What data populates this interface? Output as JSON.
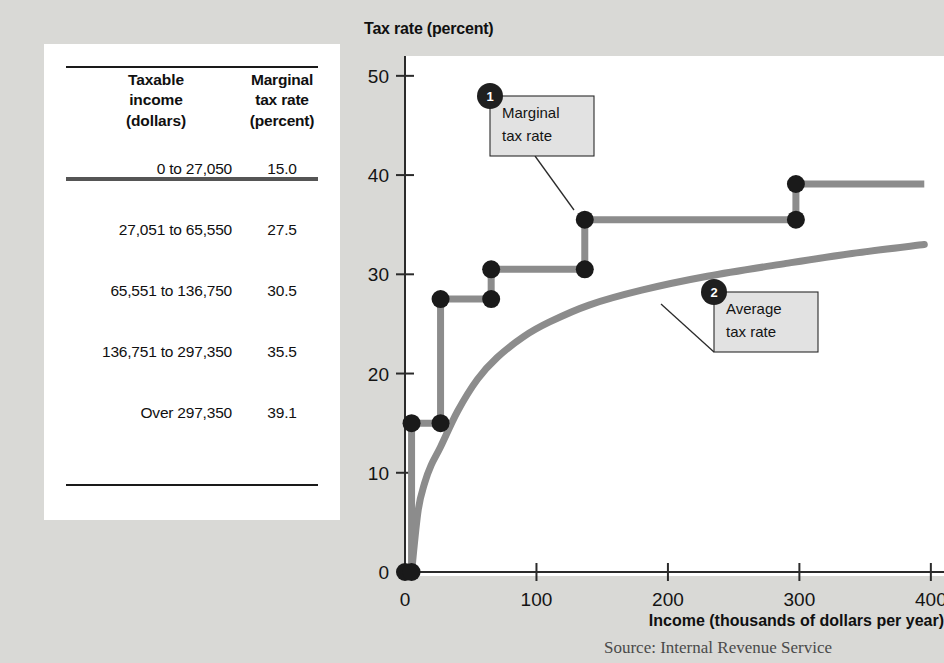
{
  "table": {
    "headers": {
      "income": [
        "Taxable",
        "income",
        "(dollars)"
      ],
      "rate": [
        "Marginal",
        "tax rate",
        "(percent)"
      ]
    },
    "rows": [
      {
        "income": "0 to 27,050",
        "rate": "15.0"
      },
      {
        "income": "27,051 to 65,550",
        "rate": "27.5"
      },
      {
        "income": "65,551 to 136,750",
        "rate": "30.5"
      },
      {
        "income": "136,751 to 297,350",
        "rate": "35.5"
      },
      {
        "income": "Over 297,350",
        "rate": "39.1"
      }
    ]
  },
  "source_note": "Source: Internal Revenue Service",
  "callouts": [
    {
      "number": "1",
      "line1": "Marginal",
      "line2": "tax rate"
    },
    {
      "number": "2",
      "line1": "Average",
      "line2": "tax rate"
    }
  ],
  "colors": {
    "page_background": "#d9d9d6",
    "plot_background": "#ffffff",
    "series_line": "#8c8c8c",
    "marker": "#1a1a1a",
    "axis": "#2b2b2b",
    "callout_fill": "#e2e2e2"
  },
  "chart_data": {
    "type": "line",
    "title": "Tax rate (percent)",
    "xlabel": "Income (thousands of dollars per year)",
    "ylabel": "Tax rate (percent)",
    "xlim": [
      0,
      410
    ],
    "ylim": [
      0,
      52
    ],
    "xticks": [
      0,
      100,
      200,
      300,
      400
    ],
    "yticks": [
      0,
      10,
      20,
      30,
      40,
      50
    ],
    "grid": false,
    "legend": "annotated-callouts",
    "series": [
      {
        "name": "Marginal tax rate",
        "style": "step",
        "brackets": [
          {
            "income_from": 0,
            "income_to": 27.05,
            "rate": 15.0
          },
          {
            "income_from": 27.051,
            "income_to": 65.55,
            "rate": 27.5
          },
          {
            "income_from": 65.551,
            "income_to": 136.75,
            "rate": 30.5
          },
          {
            "income_from": 136.751,
            "income_to": 297.35,
            "rate": 35.5
          },
          {
            "income_from": 297.35,
            "income_to": 400,
            "rate": 39.1
          }
        ],
        "markers": [
          {
            "x": 0,
            "y": 0
          },
          {
            "x": 5,
            "y": 0
          },
          {
            "x": 5,
            "y": 15.0
          },
          {
            "x": 27.05,
            "y": 15.0
          },
          {
            "x": 27.05,
            "y": 27.5
          },
          {
            "x": 65.55,
            "y": 27.5
          },
          {
            "x": 65.55,
            "y": 30.5
          },
          {
            "x": 136.75,
            "y": 30.5
          },
          {
            "x": 136.75,
            "y": 35.5
          },
          {
            "x": 297.35,
            "y": 35.5
          },
          {
            "x": 297.35,
            "y": 39.1
          }
        ]
      },
      {
        "name": "Average tax rate",
        "style": "curve",
        "points": [
          {
            "x": 5,
            "y": 0
          },
          {
            "x": 10,
            "y": 6.2
          },
          {
            "x": 15,
            "y": 9.0
          },
          {
            "x": 20,
            "y": 10.8
          },
          {
            "x": 27,
            "y": 12.6
          },
          {
            "x": 40,
            "y": 16.2
          },
          {
            "x": 55,
            "y": 19.4
          },
          {
            "x": 70,
            "y": 21.6
          },
          {
            "x": 90,
            "y": 23.7
          },
          {
            "x": 110,
            "y": 25.2
          },
          {
            "x": 140,
            "y": 26.9
          },
          {
            "x": 180,
            "y": 28.4
          },
          {
            "x": 230,
            "y": 29.8
          },
          {
            "x": 290,
            "y": 31.1
          },
          {
            "x": 340,
            "y": 32.1
          },
          {
            "x": 395,
            "y": 33.0
          }
        ]
      }
    ]
  }
}
